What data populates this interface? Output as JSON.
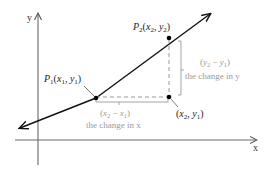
{
  "diagram": {
    "axes": {
      "x_label": "x",
      "y_label": "y"
    },
    "points": {
      "p1": {
        "name": "P",
        "sub": "1",
        "coords": "(x₁, y₁)",
        "label_text": "P₁(x₁, y₁)"
      },
      "p2": {
        "name": "P",
        "sub": "2",
        "coords": "(x₂, y₂)",
        "label_text": "P₂(x₂, y₂)"
      },
      "corner": {
        "label_text": "(x₂, y₁)"
      }
    },
    "run": {
      "expr": "(x₂ − x₁)",
      "desc": "the change in x"
    },
    "rise": {
      "expr": "(y₂ − y₁)",
      "desc": "the change in y"
    },
    "colors": {
      "line": "#111111",
      "axes": "#555555",
      "dashed": "#9a9a9a",
      "annotation": "#9a9a9a",
      "points": "#000000"
    }
  }
}
